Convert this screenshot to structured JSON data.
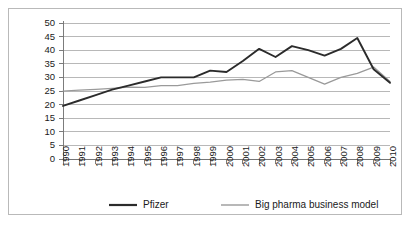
{
  "chart_data": {
    "type": "line",
    "title": "",
    "xlabel": "",
    "ylabel": "",
    "ylim": [
      0,
      50
    ],
    "ytick_step": 5,
    "grid": true,
    "legend_position": "bottom",
    "categories": [
      "1990",
      "1991",
      "1992",
      "1993",
      "1994",
      "1995",
      "1996",
      "1997",
      "1998",
      "1999",
      "2000",
      "2001",
      "2002",
      "2003",
      "2004",
      "2005",
      "2006",
      "2007",
      "2008",
      "2009",
      "2010"
    ],
    "ytick_labels": [
      "0",
      "5",
      "10",
      "15",
      "20",
      "25",
      "30",
      "35",
      "40",
      "45",
      "50"
    ],
    "series": [
      {
        "name": "Pfizer",
        "color": "#2b2b2b",
        "values": [
          19.5,
          21.5,
          23.5,
          25.5,
          27.0,
          28.5,
          30.0,
          30.0,
          30.0,
          32.5,
          32.0,
          36.0,
          40.5,
          37.5,
          41.5,
          40.0,
          38.0,
          40.5,
          44.5,
          33.0,
          28.0
        ]
      },
      {
        "name": "Big pharma business model",
        "color": "#9a9a9a",
        "values": [
          25.0,
          25.3,
          25.6,
          26.0,
          26.4,
          26.3,
          27.0,
          27.0,
          27.8,
          28.3,
          29.0,
          29.3,
          28.5,
          32.0,
          32.5,
          30.0,
          27.5,
          30.0,
          31.5,
          33.8,
          28.5
        ]
      }
    ]
  },
  "legend": {
    "items": [
      {
        "label": "Pfizer",
        "color": "#2b2b2b"
      },
      {
        "label": "Big pharma business model",
        "color": "#9a9a9a"
      }
    ]
  }
}
